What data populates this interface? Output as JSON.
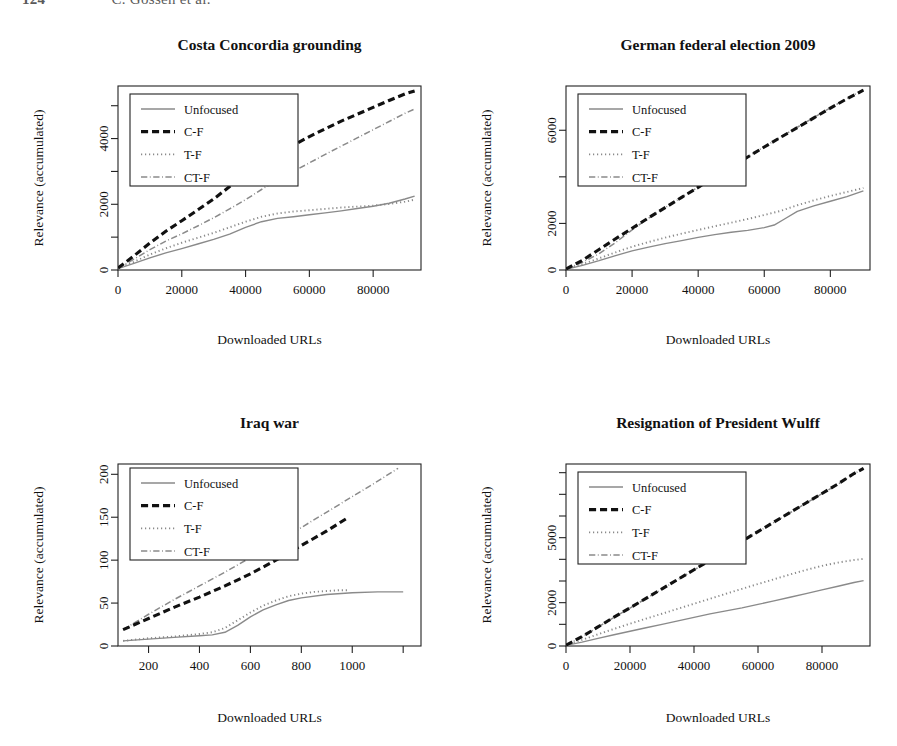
{
  "header": {
    "folio": "124",
    "authors": "C. Gossen et al."
  },
  "common": {
    "xlabel": "Downloaded URLs",
    "ylabel": "Relevance (accumulated)",
    "legend": [
      {
        "label": "Unfocused",
        "style": "solid",
        "color": "#8a8a8a",
        "width": 1.4
      },
      {
        "label": "C-F",
        "style": "dashed",
        "color": "#111111",
        "width": 3.1
      },
      {
        "label": "T-F",
        "style": "dotted",
        "color": "#8a8a8a",
        "width": 1.9
      },
      {
        "label": "CT-F",
        "style": "dashdot",
        "color": "#8a8a8a",
        "width": 1.5
      }
    ]
  },
  "chart_data": [
    {
      "id": "costa-concordia-grounding",
      "type": "line",
      "title": "Costa Concordia grounding",
      "xlabel": "Downloaded URLs",
      "ylabel": "Relevance (accumulated)",
      "xlim": [
        0,
        95000
      ],
      "ylim": [
        0,
        5600
      ],
      "xticks": [
        0,
        20000,
        40000,
        60000,
        80000
      ],
      "xticklabels": [
        "0",
        "20000",
        "40000",
        "60000",
        "80000"
      ],
      "yticks": [
        0,
        1000,
        2000,
        3000,
        4000,
        5000
      ],
      "yticklabels": [
        "0",
        "",
        "2000",
        "",
        "4000",
        ""
      ],
      "grid": false,
      "legend_position": "top-left",
      "series": [
        {
          "name": "Unfocused",
          "x": [
            0,
            5000,
            10000,
            15000,
            20000,
            25000,
            30000,
            35000,
            40000,
            45000,
            50000,
            55000,
            60000,
            65000,
            70000,
            75000,
            80000,
            85000,
            90000,
            93000
          ],
          "y": [
            40,
            200,
            370,
            520,
            650,
            790,
            930,
            1090,
            1300,
            1470,
            1570,
            1620,
            1680,
            1740,
            1800,
            1870,
            1940,
            2030,
            2160,
            2250
          ]
        },
        {
          "name": "C-F",
          "x": [
            0,
            5000,
            10000,
            15000,
            20000,
            25000,
            30000,
            35000,
            40000,
            45000,
            50000,
            55000,
            60000,
            65000,
            70000,
            75000,
            80000,
            85000,
            90000,
            93000
          ],
          "y": [
            60,
            430,
            820,
            1180,
            1500,
            1830,
            2160,
            2540,
            2930,
            3250,
            3540,
            3800,
            4060,
            4300,
            4530,
            4740,
            4950,
            5160,
            5360,
            5450
          ]
        },
        {
          "name": "T-F",
          "x": [
            0,
            5000,
            10000,
            15000,
            20000,
            25000,
            30000,
            35000,
            40000,
            45000,
            50000,
            55000,
            60000,
            65000,
            70000,
            75000,
            80000,
            85000,
            90000,
            93000
          ],
          "y": [
            50,
            250,
            470,
            660,
            830,
            980,
            1130,
            1300,
            1470,
            1620,
            1720,
            1780,
            1820,
            1860,
            1900,
            1930,
            1960,
            2010,
            2080,
            2140
          ]
        },
        {
          "name": "CT-F",
          "x": [
            0,
            5000,
            10000,
            15000,
            20000,
            25000,
            30000,
            35000,
            40000,
            45000,
            50000,
            55000,
            60000,
            65000,
            70000,
            75000,
            80000,
            85000,
            90000,
            93000
          ],
          "y": [
            50,
            330,
            620,
            880,
            1100,
            1340,
            1590,
            1860,
            2140,
            2450,
            2740,
            3000,
            3260,
            3520,
            3770,
            4020,
            4270,
            4520,
            4770,
            4900
          ]
        }
      ]
    },
    {
      "id": "german-federal-election-2009",
      "type": "line",
      "title": "German federal election 2009",
      "xlabel": "Downloaded URLs",
      "ylabel": "Relevance (accumulated)",
      "xlim": [
        0,
        92000
      ],
      "ylim": [
        0,
        7900
      ],
      "xticks": [
        0,
        20000,
        40000,
        60000,
        80000
      ],
      "xticklabels": [
        "0",
        "20000",
        "40000",
        "60000",
        "80000"
      ],
      "yticks": [
        0,
        2000,
        4000,
        6000
      ],
      "yticklabels": [
        "0",
        "2000",
        "",
        "6000"
      ],
      "grid": false,
      "legend_position": "top-left",
      "series": [
        {
          "name": "Unfocused",
          "x": [
            0,
            5000,
            10000,
            15000,
            20000,
            25000,
            30000,
            35000,
            40000,
            45000,
            50000,
            55000,
            60000,
            63000,
            66000,
            70000,
            75000,
            80000,
            85000,
            90000
          ],
          "y": [
            30,
            200,
            400,
            620,
            820,
            980,
            1130,
            1260,
            1400,
            1520,
            1620,
            1700,
            1820,
            1930,
            2180,
            2520,
            2750,
            2950,
            3150,
            3400
          ]
        },
        {
          "name": "C-F",
          "x": [
            0,
            5000,
            10000,
            15000,
            20000,
            25000,
            30000,
            35000,
            40000,
            45000,
            50000,
            55000,
            60000,
            65000,
            70000,
            75000,
            80000,
            85000,
            90000
          ],
          "y": [
            40,
            420,
            880,
            1340,
            1790,
            2240,
            2680,
            3120,
            3550,
            4000,
            4420,
            4850,
            5280,
            5700,
            6110,
            6530,
            6950,
            7350,
            7720
          ]
        },
        {
          "name": "T-F",
          "x": [
            0,
            5000,
            10000,
            15000,
            20000,
            25000,
            30000,
            35000,
            40000,
            45000,
            50000,
            55000,
            60000,
            65000,
            70000,
            75000,
            80000,
            85000,
            90000
          ],
          "y": [
            40,
            250,
            500,
            760,
            1000,
            1200,
            1390,
            1560,
            1720,
            1880,
            2030,
            2190,
            2360,
            2540,
            2780,
            2990,
            3180,
            3350,
            3520
          ]
        },
        {
          "name": "CT-F",
          "x": [
            0,
            5000,
            10000,
            15000,
            20000,
            25000,
            30000,
            35000,
            40000,
            45000,
            50000,
            55000,
            60000,
            65000,
            70000,
            75000,
            80000,
            85000,
            90000
          ],
          "y": [
            40,
            330,
            700,
            1180,
            1720,
            2230,
            2680,
            3120,
            3560,
            4010,
            4430,
            4860,
            5290,
            5710,
            6130,
            6550,
            6960,
            7360,
            7740
          ]
        }
      ]
    },
    {
      "id": "iraq-war",
      "type": "line",
      "title": "Iraq war",
      "xlabel": "Downloaded URLs",
      "ylabel": "Relevance (accumulated)",
      "xlim": [
        80,
        1270
      ],
      "ylim": [
        0,
        212
      ],
      "xticks": [
        200,
        400,
        600,
        800,
        1000,
        1200
      ],
      "xticklabels": [
        "200",
        "400",
        "600",
        "800",
        "1000",
        ""
      ],
      "yticks": [
        0,
        50,
        100,
        150,
        200
      ],
      "yticklabels": [
        "0",
        "50",
        "100",
        "150",
        "200"
      ],
      "grid": false,
      "legend_position": "top-left",
      "series": [
        {
          "name": "Unfocused",
          "x": [
            100,
            200,
            300,
            400,
            450,
            500,
            550,
            600,
            650,
            700,
            750,
            800,
            900,
            1000,
            1100,
            1200
          ],
          "y": [
            6,
            8,
            10,
            12,
            13,
            16,
            24,
            34,
            42,
            48,
            53,
            56,
            60,
            62,
            63,
            63
          ]
        },
        {
          "name": "C-F",
          "x": [
            100,
            200,
            300,
            400,
            500,
            600,
            700,
            800,
            900,
            975
          ],
          "y": [
            19,
            32,
            45,
            57,
            70,
            84,
            100,
            117,
            134,
            148
          ]
        },
        {
          "name": "T-F",
          "x": [
            100,
            200,
            300,
            400,
            450,
            500,
            550,
            600,
            650,
            700,
            750,
            800,
            850,
            900,
            950,
            980
          ],
          "y": [
            6,
            9,
            11,
            14,
            16,
            21,
            30,
            39,
            47,
            53,
            58,
            61,
            63,
            64,
            65,
            65
          ]
        },
        {
          "name": "CT-F",
          "x": [
            100,
            200,
            300,
            400,
            500,
            600,
            700,
            800,
            900,
            1000,
            1100,
            1180
          ],
          "y": [
            19,
            37,
            54,
            70,
            86,
            103,
            120,
            138,
            156,
            174,
            192,
            207
          ]
        }
      ]
    },
    {
      "id": "resignation-of-president-wulff",
      "type": "line",
      "title": "Resignation of President Wulff",
      "xlabel": "Downloaded URLs",
      "ylabel": "Relevance (accumulated)",
      "xlim": [
        0,
        95000
      ],
      "ylim": [
        0,
        8400
      ],
      "xticks": [
        0,
        20000,
        40000,
        60000,
        80000
      ],
      "xticklabels": [
        "0",
        "20000",
        "40000",
        "60000",
        "80000"
      ],
      "yticks": [
        0,
        1000,
        2000,
        3000,
        4000,
        5000,
        6000,
        7000,
        8000
      ],
      "yticklabels": [
        "0",
        "",
        "2000",
        "",
        "",
        "5000",
        "",
        "",
        ""
      ],
      "grid": false,
      "legend_position": "top-left",
      "series": [
        {
          "name": "Unfocused",
          "x": [
            0,
            5000,
            10000,
            15000,
            20000,
            25000,
            30000,
            35000,
            40000,
            45000,
            50000,
            55000,
            60000,
            65000,
            70000,
            75000,
            80000,
            85000,
            90000,
            93000
          ],
          "y": [
            30,
            180,
            350,
            520,
            680,
            840,
            1000,
            1160,
            1320,
            1480,
            1620,
            1760,
            1920,
            2080,
            2250,
            2420,
            2590,
            2760,
            2930,
            3020
          ]
        },
        {
          "name": "C-F",
          "x": [
            0,
            5000,
            10000,
            15000,
            20000,
            25000,
            30000,
            35000,
            40000,
            45000,
            50000,
            55000,
            60000,
            65000,
            70000,
            75000,
            80000,
            85000,
            90000,
            93000
          ],
          "y": [
            40,
            430,
            880,
            1330,
            1760,
            2200,
            2640,
            3080,
            3520,
            3960,
            4400,
            4840,
            5280,
            5720,
            6160,
            6600,
            7040,
            7480,
            7960,
            8200
          ]
        },
        {
          "name": "T-F",
          "x": [
            0,
            5000,
            10000,
            15000,
            20000,
            25000,
            30000,
            35000,
            40000,
            45000,
            50000,
            55000,
            60000,
            65000,
            70000,
            75000,
            80000,
            85000,
            90000,
            93000
          ],
          "y": [
            40,
            280,
            540,
            790,
            1030,
            1260,
            1490,
            1720,
            1950,
            2180,
            2410,
            2640,
            2860,
            3080,
            3300,
            3510,
            3700,
            3850,
            3970,
            4020
          ]
        },
        {
          "name": "CT-F",
          "x": [
            0,
            5000,
            10000,
            15000,
            20000,
            25000,
            30000,
            35000,
            40000,
            45000,
            50000,
            55000,
            60000,
            65000,
            70000,
            75000,
            80000,
            85000,
            90000,
            93000
          ],
          "y": [
            40,
            420,
            870,
            1320,
            1750,
            2190,
            2630,
            3070,
            3510,
            3950,
            4390,
            4830,
            5270,
            5710,
            6150,
            6590,
            7030,
            7470,
            7950,
            8190
          ]
        }
      ]
    }
  ]
}
